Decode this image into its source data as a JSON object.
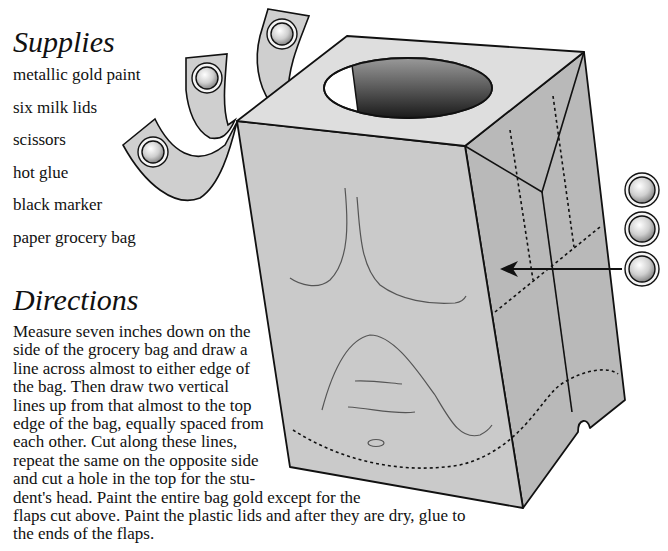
{
  "supplies": {
    "heading": "Supplies",
    "items": [
      "metallic gold paint",
      "six milk lids",
      "scissors",
      "hot glue",
      "black marker",
      "paper grocery bag"
    ]
  },
  "directions": {
    "heading": "Directions",
    "lines": [
      "Measure seven inches down on the",
      "side of the grocery bag and draw a",
      "line across almost to either edge of",
      "the bag. Then draw two vertical",
      "lines up from that almost to the top",
      "edge of the bag, equally spaced from",
      "each other. Cut along these lines,",
      "repeat the same on the opposite side",
      "and cut a hole in the top for the stu-",
      "dent's head. Paint the entire bag gold except for the",
      "flaps cut above. Paint the plastic lids and after they are dry, glue to",
      "the ends of the flaps."
    ]
  },
  "illustration": {
    "subject": "paper grocery bag costume with cut flaps and milk lids",
    "colors": {
      "bag_front": "#c9c9c9",
      "bag_top": "#dedede",
      "bag_side": "#b8b8b8",
      "outline": "#111111",
      "lid_highlight": "#ffffff",
      "lid_shadow": "#8a8a8a"
    }
  }
}
